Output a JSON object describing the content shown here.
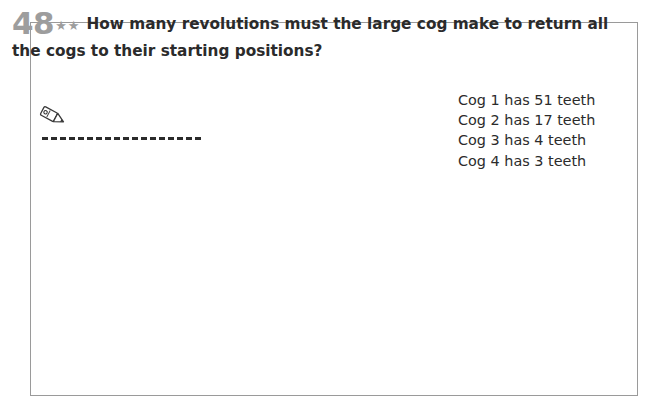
{
  "page": {
    "question_number": "48",
    "difficulty_stars": "★★",
    "question_line_1": "How many revolutions must the large cog make to return all",
    "question_line_2": "the cogs to their starting positions?",
    "answer_line_placeholder": "",
    "pencil_icon": "pencil-icon",
    "frame_color": "#9a9a9a",
    "text_color": "#2b2b2b",
    "number_color": "#9d9d9d"
  },
  "cog_facts": [
    {
      "label": "Cog 1 has 51 teeth",
      "cog": "1",
      "teeth": 51
    },
    {
      "label": "Cog 2 has 17 teeth",
      "cog": "2",
      "teeth": 17
    },
    {
      "label": "Cog 3 has 4 teeth",
      "cog": "3",
      "teeth": 4
    },
    {
      "label": "Cog 4 has 3 teeth",
      "cog": "4",
      "teeth": 3
    }
  ],
  "cogs": [
    {
      "name": "cog-1-large",
      "teeth": 51,
      "cx": 310,
      "cy": 245,
      "body_radius": 126,
      "tooth_height": 15,
      "tooth_width_ratio": 0.52,
      "tooth_shape": "rect",
      "color": "#c9c9c9",
      "rotation": 0
    },
    {
      "name": "cog-2-medium",
      "teeth": 17,
      "cx": 484,
      "cy": 248,
      "body_radius": 34,
      "tooth_height": 10,
      "tooth_width_ratio": 0.5,
      "tooth_shape": "taper",
      "color": "#8a8a8a",
      "rotation": 6
    },
    {
      "name": "cog-3-small-dark",
      "teeth": 4,
      "cx": 548,
      "cy": 280,
      "body_radius": 26,
      "tooth_height": 7,
      "tooth_width_ratio": 0.22,
      "tooth_shape": "taper",
      "color": "#3a3a3a",
      "rotation": 20
    },
    {
      "name": "cog-4-smallest-light",
      "teeth": 3,
      "cx": 579,
      "cy": 238,
      "body_radius": 21,
      "tooth_height": 6,
      "tooth_width_ratio": 0.26,
      "tooth_shape": "taper",
      "color": "#ececec",
      "rotation": -10
    }
  ]
}
